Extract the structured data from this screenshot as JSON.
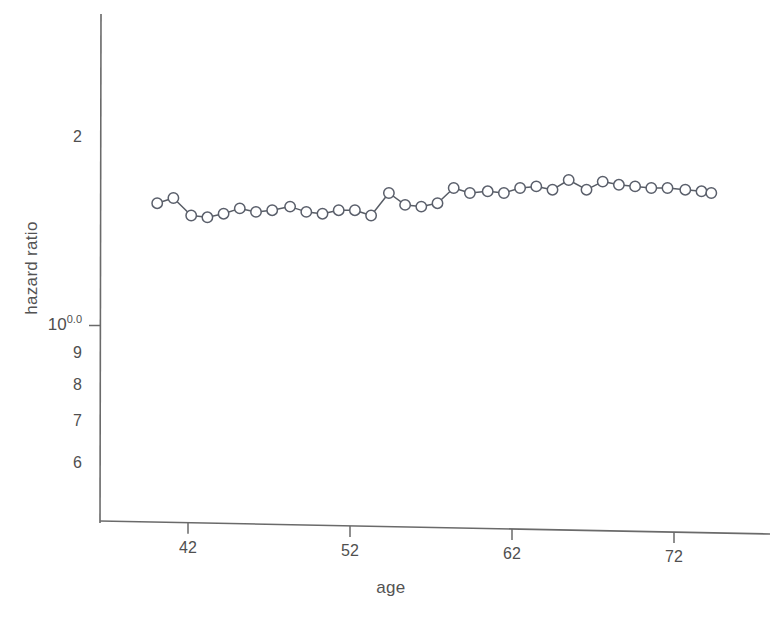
{
  "figure": {
    "background_color": "#ffffff",
    "ink_color": "#4a4a4a",
    "marker_color": "#5a5f6b",
    "line_color": "#585d66"
  },
  "chart_data": {
    "type": "line",
    "title": "",
    "subtitle": "",
    "xlabel": "age",
    "ylabel": "hazard ratio",
    "yscale": "log10",
    "grid": false,
    "legend": null,
    "marker": "open-circle",
    "xlim": [
      38.0,
      76.5
    ],
    "ylim": [
      0.55,
      2.35
    ],
    "xticks": [
      42,
      52,
      62,
      72
    ],
    "xtick_labels": [
      "42",
      "52",
      "62",
      "72"
    ],
    "yticks": [
      1.0
    ],
    "ytick_labels": [
      "10",
      "0.0"
    ],
    "ytick_major_display": "10^0.0",
    "yticks_minor": [
      0.9,
      0.8,
      0.7,
      0.6
    ],
    "ytick_minor_labels": [
      "9",
      "8",
      "7",
      "6"
    ],
    "ytick_extra": [
      2
    ],
    "ytick_extra_labels": [
      "2"
    ],
    "x": [
      40.1,
      41.1,
      42.2,
      43.2,
      44.2,
      45.2,
      46.2,
      47.2,
      48.3,
      49.3,
      50.3,
      51.3,
      52.3,
      53.3,
      54.4,
      55.4,
      56.4,
      57.4,
      58.4,
      59.4,
      60.5,
      61.5,
      62.5,
      63.5,
      64.5,
      65.5,
      66.6,
      67.6,
      68.6,
      69.6,
      70.6,
      71.6,
      72.7,
      73.7,
      74.3
    ],
    "values": [
      1.57,
      1.6,
      1.5,
      1.49,
      1.51,
      1.54,
      1.52,
      1.53,
      1.55,
      1.52,
      1.51,
      1.53,
      1.53,
      1.5,
      1.63,
      1.56,
      1.55,
      1.57,
      1.66,
      1.63,
      1.64,
      1.63,
      1.66,
      1.67,
      1.65,
      1.71,
      1.65,
      1.7,
      1.68,
      1.67,
      1.66,
      1.66,
      1.65,
      1.64,
      1.63
    ],
    "series": [
      {
        "name": "hazard ratio",
        "marker": "open-circle",
        "values": [
          1.57,
          1.6,
          1.5,
          1.49,
          1.51,
          1.54,
          1.52,
          1.53,
          1.55,
          1.52,
          1.51,
          1.53,
          1.53,
          1.5,
          1.63,
          1.56,
          1.55,
          1.57,
          1.66,
          1.63,
          1.64,
          1.63,
          1.66,
          1.67,
          1.65,
          1.71,
          1.65,
          1.7,
          1.68,
          1.67,
          1.66,
          1.66,
          1.65,
          1.64,
          1.63
        ]
      }
    ],
    "n_points": 35,
    "value_range": [
      1.49,
      1.71
    ]
  }
}
